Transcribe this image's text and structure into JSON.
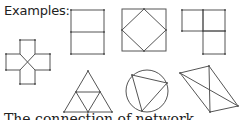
{
  "heading": "Examples:",
  "footer_text": "The connection of network",
  "colors": {
    "stroke": "#555555",
    "text": "#222222",
    "background": "#ffffff"
  },
  "figures": [
    {
      "name": "rectangle-with-midline"
    },
    {
      "name": "square-with-inscribed-diamond"
    },
    {
      "name": "l-shape-three-squares"
    },
    {
      "name": "cross-with-center-x"
    },
    {
      "name": "subdivided-triangle"
    },
    {
      "name": "circle-with-inscribed-triangle"
    },
    {
      "name": "quadrilateral-with-diagonals"
    }
  ]
}
